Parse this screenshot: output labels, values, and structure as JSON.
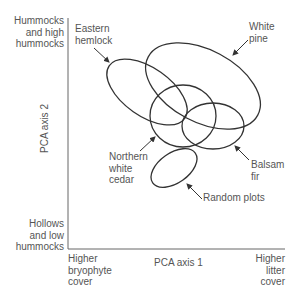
{
  "axes": {
    "x_label": "PCA axis 1",
    "y_label": "PCA axis 2",
    "y_top": [
      "Hummocks",
      "and high",
      "hummocks"
    ],
    "y_bottom": [
      "Hollows",
      "and low",
      "hummocks"
    ],
    "x_left": [
      "Higher",
      "bryophyte",
      "cover"
    ],
    "x_right": [
      "Higher",
      "litter",
      "cover"
    ]
  },
  "groups": [
    {
      "name": "Eastern hemlock",
      "lines": [
        "Eastern",
        "hemlock"
      ]
    },
    {
      "name": "White pine",
      "lines": [
        "White",
        "pine"
      ]
    },
    {
      "name": "Northern white cedar",
      "lines": [
        "Northern",
        "white",
        "cedar"
      ]
    },
    {
      "name": "Balsam fir",
      "lines": [
        "Balsam",
        "fir"
      ]
    },
    {
      "name": "Random plots",
      "lines": [
        "Random plots"
      ]
    }
  ],
  "colors": {
    "line": "#333333",
    "text": "#555555",
    "axis": "#666666"
  }
}
